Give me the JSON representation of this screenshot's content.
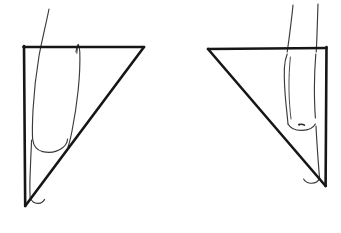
{
  "figure": {
    "background_color": "#ffffff",
    "ink_color": "#161616",
    "line_color_light": "#3a3a3a",
    "width": 341,
    "height": 233,
    "panel_count": 2,
    "caption": ""
  },
  "panels": [
    {
      "id": "left-panel",
      "name": "left-foot-panel",
      "label": "",
      "orientation": "toes-point-right",
      "triangle": {
        "name": "left-triangle",
        "type": "right-triangle",
        "vertices": [
          {
            "label": "top-left",
            "x": 24,
            "y": 47
          },
          {
            "label": "top-right",
            "x": 144,
            "y": 47
          },
          {
            "label": "bottom-left",
            "x": 25,
            "y": 206
          }
        ],
        "right_angle_at": "top-left",
        "stroke_width": 2.6,
        "color": "#161616"
      },
      "foot": {
        "name": "left-foot-outline",
        "parts": [
          "anterior-shin-line",
          "posterior-shin-line",
          "heel-curve",
          "sole-line"
        ],
        "color": "#3a3a3a"
      }
    },
    {
      "id": "right-panel",
      "name": "right-foot-panel",
      "label": "",
      "orientation": "toes-point-left",
      "triangle": {
        "name": "right-triangle",
        "type": "right-triangle",
        "vertices": [
          {
            "label": "top-left",
            "x": 208,
            "y": 49
          },
          {
            "label": "top-right",
            "x": 326,
            "y": 48
          },
          {
            "label": "bottom-right",
            "x": 326,
            "y": 186
          }
        ],
        "right_angle_at": "top-right",
        "stroke_width": 2.6,
        "color": "#161616"
      },
      "foot": {
        "name": "right-foot-outline",
        "parts": [
          "anterior-shin-line",
          "posterior-shin-line",
          "malleolus-mark",
          "heel-curve",
          "sole-line"
        ],
        "color": "#3a3a3a"
      }
    }
  ],
  "annotations": {
    "text_items": []
  }
}
